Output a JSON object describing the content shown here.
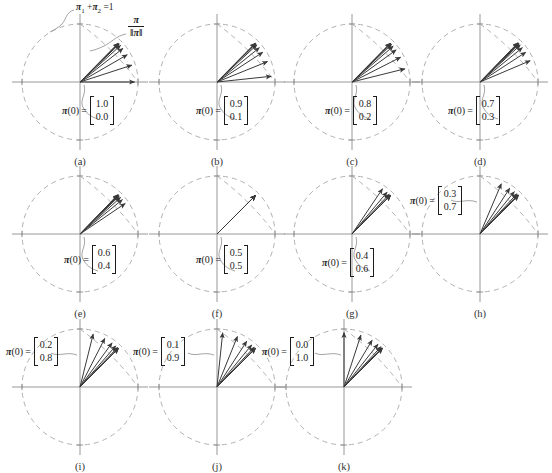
{
  "figure": {
    "annotations": {
      "constraint": "π₁ + π₂ = 1",
      "constraint_pi": "π",
      "constraint_sub1": "1",
      "constraint_plus": "+",
      "constraint_sub2": "2",
      "constraint_eq": "= 1",
      "normalized_num": "π",
      "normalized_den": "‖π‖"
    },
    "label_lhs": "π",
    "label_paren": "(0)",
    "label_eq": "="
  },
  "chart_data": {
    "type": "scatter",
    "xlabel": "π₁",
    "ylabel": "π₂",
    "xlim": [
      -1.15,
      1.15
    ],
    "ylim": [
      -1.15,
      1.15
    ],
    "grid": false,
    "legend": "none",
    "unit_circle": true,
    "constraint_line": "π₁ + π₂ = 1",
    "fixed_point_angle_deg": 45,
    "panels": [
      {
        "id": "a",
        "caption": "(a)",
        "pi0": [
          "1.0",
          "0.0"
        ],
        "label_side": "right",
        "label_x": 62,
        "label_y": 96,
        "vector_angles_deg": [
          0,
          18,
          30,
          38,
          42,
          44,
          45,
          45.5
        ],
        "vector_count": 8
      },
      {
        "id": "b",
        "caption": "(b)",
        "pi0": [
          "0.9",
          "0.1"
        ],
        "label_side": "right",
        "label_x": 196,
        "label_y": 96,
        "vector_angles_deg": [
          6,
          22,
          33,
          39,
          43,
          44.5,
          45,
          45.5
        ],
        "vector_count": 8
      },
      {
        "id": "c",
        "caption": "(c)",
        "pi0": [
          "0.8",
          "0.2"
        ],
        "label_side": "right",
        "label_x": 325,
        "label_y": 96,
        "vector_angles_deg": [
          14,
          27,
          36,
          41,
          43.5,
          44.5,
          45,
          45.5
        ],
        "vector_count": 8
      },
      {
        "id": "d",
        "caption": "(d)",
        "pi0": [
          "0.7",
          "0.3"
        ],
        "label_side": "right",
        "label_x": 448,
        "label_y": 96,
        "vector_angles_deg": [
          23,
          33,
          39,
          42.5,
          44,
          45,
          45.5,
          46
        ],
        "vector_count": 8
      },
      {
        "id": "e",
        "caption": "(e)",
        "pi0": [
          "0.6",
          "0.4"
        ],
        "label_side": "right",
        "label_x": 64,
        "label_y": 245,
        "vector_angles_deg": [
          34,
          39,
          42,
          44,
          45,
          45.5,
          46,
          46
        ],
        "vector_count": 8
      },
      {
        "id": "f",
        "caption": "(f)",
        "pi0": [
          "0.5",
          "0.5"
        ],
        "label_side": "right",
        "label_x": 196,
        "label_y": 245,
        "vector_angles_deg": [
          45,
          45,
          45,
          45,
          45,
          45,
          45,
          45
        ],
        "vector_count": 8
      },
      {
        "id": "g",
        "caption": "(g)",
        "pi0": [
          "0.4",
          "0.6"
        ],
        "label_side": "right",
        "label_x": 322,
        "label_y": 248,
        "vector_angles_deg": [
          56,
          50,
          47,
          45.5,
          45,
          45,
          45,
          45
        ],
        "vector_count": 8
      },
      {
        "id": "h",
        "caption": "(h)",
        "pi0": [
          "0.3",
          "0.7"
        ],
        "label_side": "left",
        "label_x": 410,
        "label_y": 186,
        "vector_angles_deg": [
          67,
          57,
          51,
          47.5,
          46,
          45.5,
          45,
          45
        ],
        "vector_count": 8
      },
      {
        "id": "i",
        "caption": "(i)",
        "pi0": [
          "0.2",
          "0.8"
        ],
        "label_side": "left",
        "label_x": 6,
        "label_y": 337,
        "vector_angles_deg": [
          76,
          63,
          54,
          49,
          46.5,
          45.5,
          45,
          45
        ],
        "vector_count": 8
      },
      {
        "id": "j",
        "caption": "(j)",
        "pi0": [
          "0.1",
          "0.9"
        ],
        "label_side": "left",
        "label_x": 133,
        "label_y": 337,
        "vector_angles_deg": [
          84,
          68,
          57,
          50.5,
          47,
          45.5,
          45,
          45
        ],
        "vector_count": 8
      },
      {
        "id": "k",
        "caption": "(k)",
        "pi0": [
          "0.0",
          "1.0"
        ],
        "label_side": "left",
        "label_x": 262,
        "label_y": 337,
        "vector_angles_deg": [
          90,
          72,
          59,
          51.5,
          47.5,
          46,
          45,
          45
        ],
        "vector_count": 8
      }
    ],
    "panel_positions": [
      {
        "id": "a",
        "x": 8,
        "y": 10,
        "r": 58,
        "cap_y": 140
      },
      {
        "id": "b",
        "x": 145,
        "y": 10,
        "r": 58,
        "cap_y": 140
      },
      {
        "id": "c",
        "x": 280,
        "y": 10,
        "r": 58,
        "cap_y": 140
      },
      {
        "id": "d",
        "x": 408,
        "y": 10,
        "r": 58,
        "cap_y": 140
      },
      {
        "id": "e",
        "x": 8,
        "y": 162,
        "r": 58,
        "cap_y": 292
      },
      {
        "id": "f",
        "x": 145,
        "y": 162,
        "r": 58,
        "cap_y": 292
      },
      {
        "id": "g",
        "x": 280,
        "y": 162,
        "r": 58,
        "cap_y": 292
      },
      {
        "id": "h",
        "x": 408,
        "y": 162,
        "r": 58,
        "cap_y": 292
      },
      {
        "id": "i",
        "x": 8,
        "y": 315,
        "r": 58,
        "cap_y": 445
      },
      {
        "id": "j",
        "x": 145,
        "y": 315,
        "r": 58,
        "cap_y": 445
      },
      {
        "id": "k",
        "x": 272,
        "y": 315,
        "r": 58,
        "cap_y": 445
      }
    ],
    "style": {
      "circle_color": "#a8a8a8",
      "axis_color": "#8c8c8c",
      "vector_color": "#3a3a3a",
      "constraint_color": "#a8a8a8",
      "leader_color": "#8c8c8c"
    }
  }
}
